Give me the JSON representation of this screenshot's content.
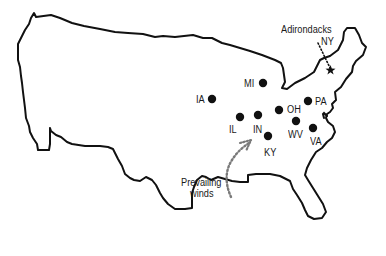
{
  "map": {
    "title_label": "Adirondacks",
    "target_state_label": "NY",
    "outline_color": "#111111",
    "dot_color": "#111111",
    "background": "#ffffff"
  },
  "states": [
    {
      "abbr": "MI",
      "dot": [
        263,
        83
      ],
      "label_pos": [
        244,
        77
      ]
    },
    {
      "abbr": "IA",
      "dot": [
        212,
        99
      ],
      "label_pos": [
        196,
        94
      ]
    },
    {
      "abbr": "OH",
      "dot": [
        279,
        110
      ],
      "label_pos": [
        287,
        104
      ]
    },
    {
      "abbr": "PA",
      "dot": [
        308,
        101
      ],
      "label_pos": [
        316,
        96
      ]
    },
    {
      "abbr": "IL",
      "dot": [
        240,
        117
      ],
      "label_pos": [
        228,
        124
      ]
    },
    {
      "abbr": "IN",
      "dot": [
        258,
        115
      ],
      "label_pos": [
        252,
        124
      ]
    },
    {
      "abbr": "WV",
      "dot": [
        296,
        121
      ],
      "label_pos": [
        289,
        129
      ]
    },
    {
      "abbr": "VA",
      "dot": [
        313,
        128
      ],
      "label_pos": [
        310,
        136
      ]
    },
    {
      "abbr": "KY",
      "dot": [
        268,
        136
      ],
      "label_pos": [
        263,
        146
      ]
    }
  ],
  "annotations": {
    "adirondacks": "Adirondacks",
    "ny": "NY",
    "prevailing_line1": "Prevailing",
    "prevailing_line2": "winds"
  },
  "labels": {
    "MI": "MI",
    "IA": "IA",
    "OH": "OH",
    "PA": "PA",
    "IL": "IL",
    "IN": "IN",
    "WV": "WV",
    "VA": "VA",
    "KY": "KY"
  }
}
